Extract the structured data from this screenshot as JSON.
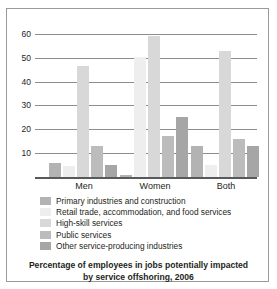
{
  "chart_data": {
    "type": "bar",
    "title": "",
    "caption_line1": "Percentage of employees in jobs potentially impacted",
    "caption_line2": "by service offshoring, 2006",
    "xlabel": "",
    "ylabel": "",
    "ylim": [
      0,
      65
    ],
    "grid": true,
    "legend_position": "below",
    "yticks": [
      10,
      20,
      30,
      40,
      50,
      60
    ],
    "categories": [
      "Men",
      "Women",
      "Both"
    ],
    "series": [
      {
        "name": "Primary industries and construction",
        "color": "#b3b3b3",
        "values": [
          6,
          1,
          13
        ]
      },
      {
        "name": "Retail trade, accommodation, and food services",
        "color": "#eeeeee",
        "values": [
          4.5,
          50.5,
          5
        ]
      },
      {
        "name": "High-skill services",
        "color": "#d8d8d8",
        "values": [
          46.5,
          59,
          53
        ]
      },
      {
        "name": "Public services",
        "color": "#bcbcbc",
        "values": [
          13,
          17,
          16
        ]
      },
      {
        "name": "Other service-producing industries",
        "color": "#a6a6a6",
        "values": [
          5,
          25,
          13
        ]
      }
    ]
  },
  "axis": {
    "tick_labels": [
      "60",
      "50",
      "40",
      "30",
      "20",
      "10"
    ]
  },
  "x_axis": {
    "labels": [
      "Men",
      "Women",
      "Both"
    ]
  },
  "legend": {
    "items": [
      {
        "label": "Primary industries and construction"
      },
      {
        "label": "Retail trade, accommodation, and food services"
      },
      {
        "label": "High-skill services"
      },
      {
        "label": "Public services"
      },
      {
        "label": "Other service-producing industries"
      }
    ]
  },
  "caption": {
    "line1": "Percentage of employees in jobs potentially impacted",
    "line2": "by service offshoring, 2006"
  }
}
